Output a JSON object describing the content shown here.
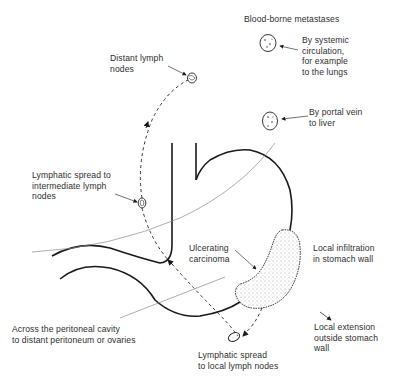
{
  "diagram": {
    "labels": {
      "blood_borne_heading": "Blood-borne metastases",
      "systemic": "By systemic\ncirculation,\nfor example\nto the lungs",
      "portal": "By portal vein\nto liver",
      "distant_lymph": "Distant lymph\nnodes",
      "intermediate_lymph": "Lymphatic spread to\nintermediate lymph\nnodes",
      "ulcerating": "Ulcerating\ncarcinoma",
      "local_infiltration": "Local infiltration\nin stomach wall",
      "local_extension": "Local extension\noutside stomach\nwall",
      "peritoneal": "Across the peritoneal cavity\nto distant peritoneum or ovaries",
      "local_lymph": "Lymphatic spread\nto local lymph nodes"
    },
    "colors": {
      "line": "#1a1a1a",
      "thin_line": "#8a8a8a",
      "text": "#2e2e2e",
      "background": "#ffffff"
    }
  }
}
